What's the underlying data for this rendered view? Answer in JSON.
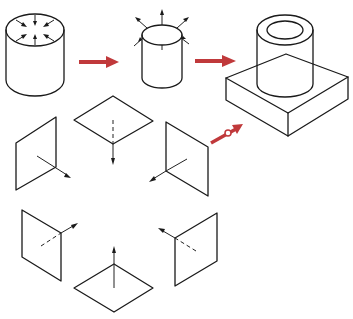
{
  "diagram": {
    "colors": {
      "line": "#1a1a1a",
      "flow_arrow": "#c0393b",
      "background": "#ffffff"
    },
    "nodes": [
      {
        "id": "cylinder-inward",
        "label": "",
        "kind": "cylinder with inward arrows on top face"
      },
      {
        "id": "cylinder-outward",
        "label": "",
        "kind": "cylinder with outward normal arrows"
      },
      {
        "id": "final-solid",
        "label": "",
        "kind": "hollow cylinder boss on square block"
      },
      {
        "id": "plane-top",
        "label": "",
        "kind": "horizontal plane, normal pointing down"
      },
      {
        "id": "plane-left-upper",
        "label": "",
        "kind": "vertical plane, normal pointing right-down"
      },
      {
        "id": "plane-right-upper",
        "label": "",
        "kind": "vertical plane, normal pointing left-down"
      },
      {
        "id": "plane-left-lower",
        "label": "",
        "kind": "vertical plane, normal pointing right-up"
      },
      {
        "id": "plane-right-lower",
        "label": "",
        "kind": "vertical plane, normal pointing left-up"
      },
      {
        "id": "plane-bottom",
        "label": "",
        "kind": "horizontal plane, normal pointing up"
      }
    ],
    "edges": [
      {
        "from": "cylinder-inward",
        "to": "cylinder-outward",
        "style": "red arrow"
      },
      {
        "from": "cylinder-outward",
        "to": "final-solid",
        "style": "red arrow"
      },
      {
        "from": "plane-right-upper",
        "to": "final-solid",
        "style": "red arrow"
      }
    ]
  }
}
